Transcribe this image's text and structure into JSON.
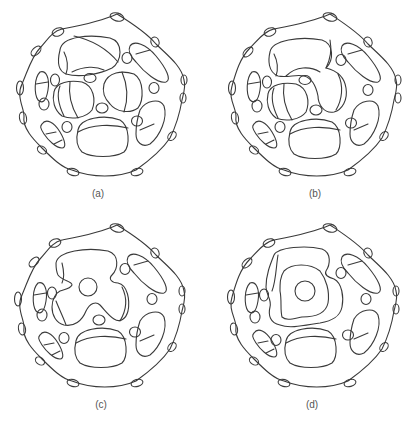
{
  "figure": {
    "panels": [
      {
        "id": "a",
        "label": "(a)",
        "description": "Porous spherical cage structure with separated internal cavities"
      },
      {
        "id": "b",
        "label": "(b)",
        "description": "Cage structure where upper-left and middle-right cavities begin to merge"
      },
      {
        "id": "c",
        "label": "(c)",
        "description": "Cage structure with central cavities coalesced into a large channel around a central circular void"
      },
      {
        "id": "d",
        "label": "(d)",
        "description": "Cage structure with a single large merged central cavity enclosing a circular void"
      }
    ],
    "colors": {
      "background": "#ffffff",
      "stroke": "#3a3a3a",
      "label": "#555555"
    }
  }
}
